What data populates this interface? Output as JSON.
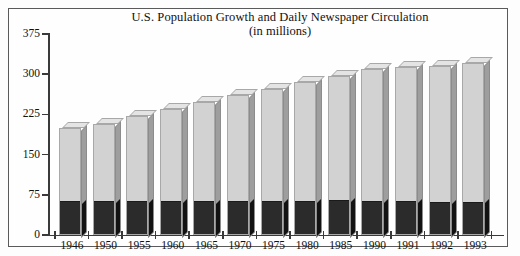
{
  "chart_data": {
    "type": "bar",
    "title": "U.S. Population Growth and Daily Newspaper Circulation",
    "subtitle": "(in millions)",
    "xlabel": "",
    "ylabel": "",
    "ylim": [
      0,
      375
    ],
    "yticks": [
      0,
      75,
      150,
      225,
      300,
      375
    ],
    "ytick_labels": [
      "0",
      "75",
      "150",
      "225",
      "300",
      "375"
    ],
    "grid": false,
    "legend": "none",
    "stacked": true,
    "categories": [
      "1946",
      "1950",
      "1955",
      "1960",
      "1965",
      "1970",
      "1975",
      "1980",
      "1985",
      "1990",
      "1991",
      "1992",
      "1993"
    ],
    "series": [
      {
        "name": "Daily Newspaper Circulation",
        "color": "#2b2b2b",
        "values": [
          61,
          62,
          62,
          62,
          61,
          62,
          61,
          62,
          63,
          62,
          61,
          60,
          60
        ]
      },
      {
        "name": "U.S. Population",
        "color": "#d2d2d2",
        "values": [
          200,
          208,
          222,
          236,
          249,
          262,
          272,
          285,
          296,
          310,
          313,
          316,
          320
        ]
      }
    ],
    "totals": [
      200,
      208,
      222,
      236,
      249,
      262,
      272,
      285,
      296,
      310,
      313,
      316,
      320
    ]
  }
}
